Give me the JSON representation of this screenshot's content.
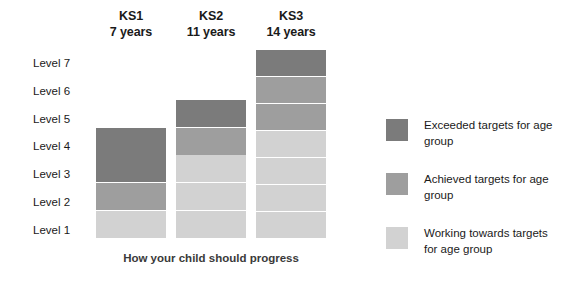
{
  "caption": "How your child should progress",
  "colors": {
    "exceeded": "#7b7b7b",
    "achieved": "#9e9e9e",
    "working": "#d2d2d2",
    "background": "#ffffff",
    "text": "#1a1a1a"
  },
  "columns": [
    {
      "stage": "KS1",
      "age": "7 years"
    },
    {
      "stage": "KS2",
      "age": "11 years"
    },
    {
      "stage": "KS3",
      "age": "14 years"
    }
  ],
  "levels": [
    {
      "label": "Level 7"
    },
    {
      "label": "Level 6"
    },
    {
      "label": "Level 5"
    },
    {
      "label": "Level 4"
    },
    {
      "label": "Level 3"
    },
    {
      "label": "Level 2"
    },
    {
      "label": "Level 1"
    }
  ],
  "legend": [
    {
      "swatch": "exceeded",
      "label": "Exceeded targets for age group"
    },
    {
      "swatch": "achieved",
      "label": "Achieved targets for age group"
    },
    {
      "swatch": "working",
      "label": "Working towards targets for age group"
    }
  ],
  "chart_data": {
    "type": "bar",
    "title": "How your child should progress",
    "xlabel": "",
    "ylabel": "",
    "categories": [
      "KS1",
      "KS2",
      "KS3"
    ],
    "category_sublabels": [
      "7 years",
      "11 years",
      "14 years"
    ],
    "y_tick_labels": [
      "Level 1",
      "Level 2",
      "Level 3",
      "Level 4",
      "Level 5",
      "Level 6",
      "Level 7"
    ],
    "ylim": [
      0,
      7
    ],
    "grid": false,
    "legend_position": "right",
    "legend_entries": [
      "Exceeded targets for age group",
      "Achieved targets for age group",
      "Working towards targets for age group"
    ],
    "values": [
      4,
      5,
      7
    ],
    "stacks": [
      {
        "category": "KS1",
        "top_level": 4,
        "cells": [
          {
            "level": 4,
            "status": "exceeded"
          },
          {
            "level": 3,
            "status": "exceeded"
          },
          {
            "level": 2,
            "status": "achieved"
          },
          {
            "level": 1,
            "status": "working"
          }
        ]
      },
      {
        "category": "KS2",
        "top_level": 5,
        "cells": [
          {
            "level": 5,
            "status": "exceeded"
          },
          {
            "level": 4,
            "status": "achieved"
          },
          {
            "level": 3,
            "status": "working"
          },
          {
            "level": 2,
            "status": "working"
          },
          {
            "level": 1,
            "status": "working"
          }
        ]
      },
      {
        "category": "KS3",
        "top_level": 7,
        "cells": [
          {
            "level": 7,
            "status": "exceeded"
          },
          {
            "level": 6,
            "status": "achieved"
          },
          {
            "level": 5,
            "status": "achieved"
          },
          {
            "level": 4,
            "status": "working"
          },
          {
            "level": 3,
            "status": "working"
          },
          {
            "level": 2,
            "status": "working"
          },
          {
            "level": 1,
            "status": "working"
          }
        ]
      }
    ]
  }
}
